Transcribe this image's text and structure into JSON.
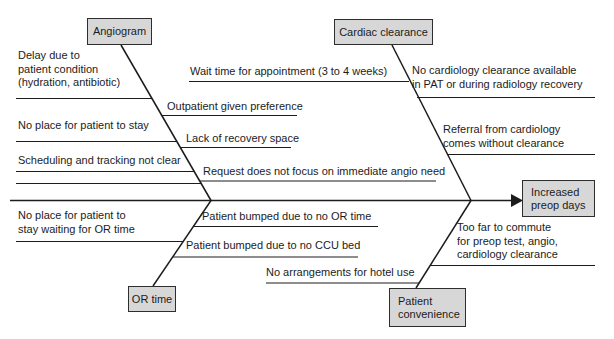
{
  "diagram_type": "fishbone-cause-effect",
  "effect": {
    "label": "Increased\npreop days"
  },
  "branches": [
    {
      "label": "Angiogram",
      "causes": [
        "Delay due to\npatient condition\n(hydration, antibiotic)",
        "No place for patient to stay",
        "Scheduling and tracking not clear",
        "Outpatient given preference",
        "Lack of recovery space",
        "Request does not focus on immediate angio need"
      ]
    },
    {
      "label": "Cardiac clearance",
      "causes": [
        "Wait time for appointment (3 to 4 weeks)",
        "No cardiology clearance available\nin PAT or during radiology recovery",
        "Referral from cardiology\ncomes without clearance"
      ]
    },
    {
      "label": "OR time",
      "causes": [
        "No place for patient to\nstay waiting for OR time",
        "Patient bumped due to no OR time",
        "Patient bumped due to no CCU bed"
      ]
    },
    {
      "label": "Patient\nconvenience",
      "causes": [
        "No arrangements for hotel use",
        "Too far to commute\nfor preop test, angio,\ncardiology clearance"
      ]
    }
  ],
  "colors": {
    "background": "#ffffff",
    "line": "#1c1c1c",
    "box_fill": "#d7d7d7",
    "box_border": "#2e2e2e",
    "text": "#1c1c1c"
  }
}
